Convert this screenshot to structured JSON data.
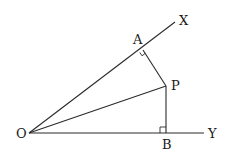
{
  "diagram": {
    "points": {
      "O": {
        "label": "O",
        "x": 29,
        "y": 133
      },
      "A": {
        "label": "A",
        "x": 143,
        "y": 50
      },
      "P": {
        "label": "P",
        "x": 166,
        "y": 86
      },
      "B": {
        "label": "B",
        "x": 166,
        "y": 133
      },
      "X": {
        "label": "X",
        "x": 175,
        "y": 22
      },
      "Y": {
        "label": "Y",
        "x": 204,
        "y": 133
      }
    },
    "segments": [
      {
        "from": "O",
        "to": "X",
        "name": "ray-ox"
      },
      {
        "from": "O",
        "to": "Y",
        "name": "ray-oy"
      },
      {
        "from": "O",
        "to": "P",
        "name": "segment-op"
      },
      {
        "from": "A",
        "to": "P",
        "name": "segment-ap"
      },
      {
        "from": "P",
        "to": "B",
        "name": "segment-pb"
      }
    ],
    "right_angles": [
      "A",
      "B"
    ],
    "colors": {
      "line": "#2a2a2a",
      "text": "#1a1a1a",
      "background": "#ffffff"
    }
  }
}
